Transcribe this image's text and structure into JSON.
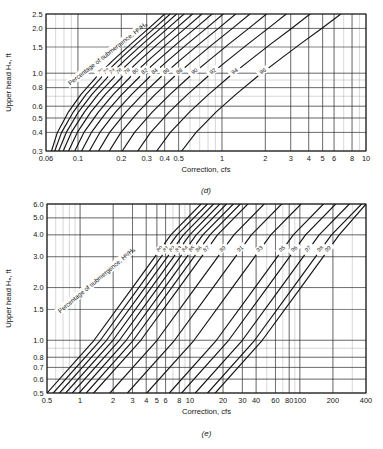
{
  "figure": {
    "background": "#ffffff",
    "ink": "#141414",
    "grid_major_color": "#2b2b2b",
    "grid_minor_color": "#8c8c8c"
  },
  "charts": [
    {
      "id": "chart-d",
      "caption": "(d)",
      "chart_data": {
        "type": "line",
        "title": "",
        "xlabel": "Correction, cfs",
        "ylabel": "Upper head Hₐ, ft",
        "xscale": "log",
        "yscale": "log",
        "xlim": [
          0.06,
          10
        ],
        "ylim": [
          0.3,
          2.5
        ],
        "grid": true,
        "legend": "inline-curve-labels",
        "xticks": [
          0.06,
          0.1,
          0.2,
          0.3,
          0.4,
          0.5,
          1,
          2,
          3,
          4,
          5,
          6,
          8,
          10
        ],
        "xticklabels": [
          "0.06",
          "0.1",
          "0.2",
          "0.3",
          "0.4",
          "0.5",
          "1",
          "2",
          "3",
          "4",
          "5",
          "6",
          "8",
          "10"
        ],
        "yticks": [
          0.3,
          0.4,
          0.5,
          0.6,
          0.8,
          1.0,
          1.5,
          2.0,
          2.5
        ],
        "yticklabels": [
          "0.3",
          "0.4",
          "0.5",
          "0.6",
          "0.8",
          "1.0",
          "1.5",
          "2.0",
          "2.5"
        ],
        "annotation": "Percentage of submergence, Hᵇ/Hₐ",
        "series": [
          {
            "name": "70",
            "x": [
              0.0655,
              0.072,
              0.086,
              0.105,
              0.135,
              0.175,
              0.235,
              0.31,
              0.4
            ],
            "y": [
              0.3,
              0.4,
              0.55,
              0.72,
              0.95,
              1.22,
              1.58,
              2.0,
              2.5
            ]
          },
          {
            "name": "72",
            "x": [
              0.069,
              0.077,
              0.093,
              0.114,
              0.147,
              0.191,
              0.256,
              0.338,
              0.437
            ],
            "y": [
              0.3,
              0.4,
              0.55,
              0.72,
              0.95,
              1.22,
              1.58,
              2.0,
              2.5
            ]
          },
          {
            "name": "74",
            "x": [
              0.0735,
              0.083,
              0.101,
              0.125,
              0.162,
              0.211,
              0.283,
              0.374,
              0.484
            ],
            "y": [
              0.3,
              0.4,
              0.55,
              0.72,
              0.95,
              1.22,
              1.58,
              2.0,
              2.5
            ]
          },
          {
            "name": "76",
            "x": [
              0.079,
              0.09,
              0.111,
              0.138,
              0.18,
              0.236,
              0.317,
              0.42,
              0.545
            ],
            "y": [
              0.3,
              0.4,
              0.55,
              0.72,
              0.95,
              1.22,
              1.58,
              2.0,
              2.5
            ]
          },
          {
            "name": "78",
            "x": [
              0.086,
              0.099,
              0.123,
              0.155,
              0.204,
              0.268,
              0.361,
              0.48,
              0.624
            ],
            "y": [
              0.3,
              0.4,
              0.55,
              0.72,
              0.95,
              1.22,
              1.58,
              2.0,
              2.5
            ]
          },
          {
            "name": "80",
            "x": [
              0.095,
              0.11,
              0.139,
              0.176,
              0.233,
              0.308,
              0.417,
              0.556,
              0.725
            ],
            "y": [
              0.3,
              0.4,
              0.55,
              0.72,
              0.95,
              1.22,
              1.58,
              2.0,
              2.5
            ]
          },
          {
            "name": "82",
            "x": [
              0.106,
              0.124,
              0.158,
              0.202,
              0.269,
              0.358,
              0.487,
              0.652,
              0.853
            ],
            "y": [
              0.3,
              0.4,
              0.55,
              0.72,
              0.95,
              1.22,
              1.58,
              2.0,
              2.5
            ]
          },
          {
            "name": "84",
            "x": [
              0.12,
              0.142,
              0.183,
              0.236,
              0.316,
              0.423,
              0.578,
              0.777,
              1.02
            ],
            "y": [
              0.3,
              0.4,
              0.55,
              0.72,
              0.95,
              1.22,
              1.58,
              2.0,
              2.5
            ]
          },
          {
            "name": "86",
            "x": [
              0.139,
              0.166,
              0.216,
              0.281,
              0.379,
              0.51,
              0.7,
              0.945,
              1.245
            ],
            "y": [
              0.3,
              0.4,
              0.55,
              0.72,
              0.95,
              1.22,
              1.58,
              2.0,
              2.5
            ]
          },
          {
            "name": "88",
            "x": [
              0.165,
              0.199,
              0.262,
              0.344,
              0.467,
              0.632,
              0.872,
              1.182,
              1.563
            ],
            "y": [
              0.3,
              0.4,
              0.55,
              0.72,
              0.95,
              1.22,
              1.58,
              2.0,
              2.5
            ]
          },
          {
            "name": "90",
            "x": [
              0.203,
              0.247,
              0.329,
              0.436,
              0.596,
              0.812,
              1.127,
              1.535,
              2.038
            ],
            "y": [
              0.3,
              0.4,
              0.55,
              0.72,
              0.95,
              1.22,
              1.58,
              2.0,
              2.5
            ]
          },
          {
            "name": "92",
            "x": [
              0.26,
              0.32,
              0.431,
              0.577,
              0.796,
              1.093,
              1.527,
              2.092,
              2.793
            ],
            "y": [
              0.3,
              0.4,
              0.55,
              0.72,
              0.95,
              1.22,
              1.58,
              2.0,
              2.5
            ]
          },
          {
            "name": "94",
            "x": [
              0.352,
              0.438,
              0.597,
              0.808,
              1.126,
              1.56,
              2.2,
              3.038,
              4.09
            ],
            "y": [
              0.3,
              0.4,
              0.55,
              0.72,
              0.95,
              1.22,
              1.58,
              2.0,
              2.5
            ]
          },
          {
            "name": "96",
            "x": [
              0.525,
              0.661,
              0.912,
              1.249,
              1.763,
              2.47,
              3.525,
              4.92,
              6.69
            ],
            "y": [
              0.3,
              0.4,
              0.55,
              0.72,
              0.95,
              1.22,
              1.58,
              2.0,
              2.5
            ]
          }
        ]
      }
    },
    {
      "id": "chart-e",
      "caption": "(e)",
      "chart_data": {
        "type": "line",
        "title": "",
        "xlabel": "Correction, cfs",
        "ylabel": "Upper head Hₐ, ft",
        "xscale": "log",
        "yscale": "log",
        "xlim": [
          0.5,
          400
        ],
        "ylim": [
          0.5,
          6.0
        ],
        "grid": true,
        "legend": "inline-curve-labels",
        "xticks": [
          0.5,
          1,
          2,
          3,
          4,
          5,
          6,
          8,
          10,
          20,
          30,
          40,
          60,
          80,
          100,
          200,
          400
        ],
        "xticklabels": [
          "0.5",
          "1",
          "2",
          "3",
          "4",
          "5",
          "6",
          "8",
          "10",
          "20",
          "30",
          "40",
          "60",
          "80",
          "100",
          "200",
          "400"
        ],
        "yticks": [
          0.5,
          0.6,
          0.7,
          0.8,
          1.0,
          1.5,
          2.0,
          3.0,
          4.0,
          5.0,
          6.0
        ],
        "yticklabels": [
          "0.5",
          "0.6",
          "0.7",
          "0.8",
          "1.0",
          "1.5",
          "2.0",
          "3.0",
          "4.0",
          "5.0",
          "6.0"
        ],
        "annotation": "Percentage of submergence, Hᵇ/Hₐ",
        "series": [
          {
            "name": "80",
            "x": [
              0.5,
              1.34,
              3.0,
              6.7,
              12.6
            ],
            "y": [
              0.5,
              1.0,
              2.0,
              4.0,
              6.0
            ]
          },
          {
            "name": "81",
            "x": [
              0.57,
              1.53,
              3.42,
              7.64,
              14.4
            ],
            "y": [
              0.5,
              1.0,
              2.0,
              4.0,
              6.0
            ]
          },
          {
            "name": "82",
            "x": [
              0.65,
              1.74,
              3.9,
              8.72,
              16.4
            ],
            "y": [
              0.5,
              1.0,
              2.0,
              4.0,
              6.0
            ]
          },
          {
            "name": "83",
            "x": [
              0.74,
              1.99,
              4.45,
              9.95,
              18.7
            ],
            "y": [
              0.5,
              1.0,
              2.0,
              4.0,
              6.0
            ]
          },
          {
            "name": "84",
            "x": [
              0.85,
              2.28,
              5.1,
              11.4,
              21.5
            ],
            "y": [
              0.5,
              1.0,
              2.0,
              4.0,
              6.0
            ]
          },
          {
            "name": "85",
            "x": [
              0.98,
              2.63,
              5.88,
              13.1,
              24.8
            ],
            "y": [
              0.5,
              1.0,
              2.0,
              4.0,
              6.0
            ]
          },
          {
            "name": "86",
            "x": [
              1.14,
              3.05,
              6.82,
              15.2,
              28.7
            ],
            "y": [
              0.5,
              1.0,
              2.0,
              4.0,
              6.0
            ]
          },
          {
            "name": "87",
            "x": [
              1.33,
              3.57,
              7.98,
              17.8,
              33.6
            ],
            "y": [
              0.5,
              1.0,
              2.0,
              4.0,
              6.0
            ]
          },
          {
            "name": "89",
            "x": [
              1.87,
              5.02,
              11.2,
              25.1,
              47.3
            ],
            "y": [
              0.5,
              1.0,
              2.0,
              4.0,
              6.0
            ]
          },
          {
            "name": "91",
            "x": [
              2.7,
              7.25,
              16.2,
              36.2,
              68.3
            ],
            "y": [
              0.5,
              1.0,
              2.0,
              4.0,
              6.0
            ]
          },
          {
            "name": "93",
            "x": [
              4.05,
              10.9,
              24.3,
              54.4,
              102.5
            ],
            "y": [
              0.5,
              1.0,
              2.0,
              4.0,
              6.0
            ]
          },
          {
            "name": "95",
            "x": [
              6.5,
              17.4,
              39.0,
              87.2,
              164.0
            ],
            "y": [
              0.5,
              1.0,
              2.0,
              4.0,
              6.0
            ]
          },
          {
            "name": "96",
            "x": [
              8.4,
              22.5,
              50.4,
              112.7,
              212.0
            ],
            "y": [
              0.5,
              1.0,
              2.0,
              4.0,
              6.0
            ]
          },
          {
            "name": "97",
            "x": [
              11.2,
              30.0,
              67.1,
              150.0,
              282.0
            ],
            "y": [
              0.5,
              1.0,
              2.0,
              4.0,
              6.0
            ]
          },
          {
            "name": "98",
            "x": [
              14.5,
              38.8,
              86.8,
              194.0,
              365.0
            ],
            "y": [
              0.5,
              1.0,
              2.0,
              4.0,
              6.0
            ]
          },
          {
            "name": "99",
            "x": [
              17.0,
              45.5,
              102.0,
              228.0,
              400.0
            ],
            "y": [
              0.5,
              1.0,
              2.0,
              4.0,
              6.0
            ]
          }
        ]
      }
    }
  ]
}
